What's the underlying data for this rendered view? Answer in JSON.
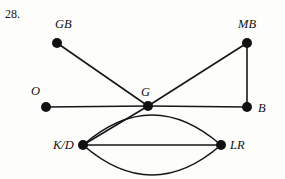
{
  "figure": {
    "number_label": "28.",
    "background_color": "#fdfdfc",
    "stroke_color": "#171717",
    "node_fill_color": "#111111",
    "node_radius": 5,
    "edge_width": 1.6,
    "width": 285,
    "height": 179
  },
  "graph": {
    "type": "undirected-multigraph",
    "nodes": [
      {
        "id": "GB",
        "label": "GB",
        "x": 57,
        "y": 43,
        "label_x": 55,
        "label_y": 18
      },
      {
        "id": "MB",
        "label": "MB",
        "x": 247,
        "y": 43,
        "label_x": 238,
        "label_y": 18
      },
      {
        "id": "O",
        "label": "O",
        "x": 46,
        "y": 107,
        "label_x": 31,
        "label_y": 85
      },
      {
        "id": "G",
        "label": "G",
        "x": 148,
        "y": 106,
        "label_x": 141,
        "label_y": 86
      },
      {
        "id": "B",
        "label": "B",
        "x": 247,
        "y": 107,
        "label_x": 258,
        "label_y": 102
      },
      {
        "id": "KD",
        "label": "K/D",
        "x": 83,
        "y": 145,
        "label_x": 53,
        "label_y": 139
      },
      {
        "id": "LR",
        "label": "LR",
        "x": 221,
        "y": 145,
        "label_x": 230,
        "label_y": 139
      }
    ],
    "edges": [
      {
        "id": "e-gb-g",
        "from": "GB",
        "to": "G",
        "shape": "straight",
        "curvature": 0
      },
      {
        "id": "e-o-g",
        "from": "O",
        "to": "G",
        "shape": "straight",
        "curvature": 0
      },
      {
        "id": "e-g-b",
        "from": "G",
        "to": "B",
        "shape": "straight",
        "curvature": 0
      },
      {
        "id": "e-mb-b",
        "from": "MB",
        "to": "B",
        "shape": "straight",
        "curvature": 0
      },
      {
        "id": "e-mb-g",
        "from": "MB",
        "to": "G",
        "shape": "straight",
        "curvature": 0
      },
      {
        "id": "e-g-kd",
        "from": "G",
        "to": "KD",
        "shape": "straight",
        "curvature": 0
      },
      {
        "id": "e-kd-lr-1",
        "from": "KD",
        "to": "LR",
        "shape": "curve-up",
        "curvature": -30
      },
      {
        "id": "e-kd-lr-2",
        "from": "KD",
        "to": "LR",
        "shape": "straight",
        "curvature": 0
      },
      {
        "id": "e-kd-lr-3",
        "from": "KD",
        "to": "LR",
        "shape": "curve-down",
        "curvature": 30
      }
    ],
    "degrees": {
      "GB": 1,
      "MB": 2,
      "O": 1,
      "G": 4,
      "B": 2,
      "KD": 4,
      "LR": 3
    }
  }
}
